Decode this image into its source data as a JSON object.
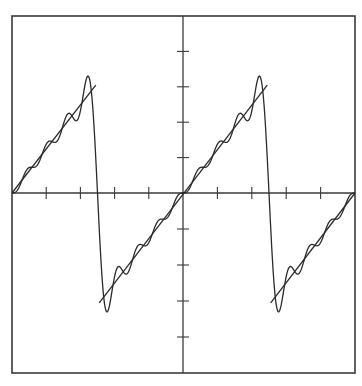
{
  "chart_data": {
    "type": "line",
    "title": "",
    "xlabel": "",
    "ylabel": "",
    "xlim": [
      -5,
      5
    ],
    "ylim": [
      -5,
      5
    ],
    "grid": false,
    "legend": null,
    "axes": {
      "x_ticks": [
        -5,
        -4,
        -3,
        -2,
        -1,
        0,
        1,
        2,
        3,
        4,
        5
      ],
      "y_ticks": [
        -5,
        -4,
        -3,
        -2,
        -1,
        0,
        1,
        2,
        3,
        4,
        5
      ],
      "tick_labels_shown": false,
      "center_axes": true,
      "frame": true
    },
    "signal": {
      "period": 5,
      "amplitude": 3.1,
      "jump_positions_x": [
        -2.5,
        2.5
      ],
      "harmonics": 8
    },
    "series": [
      {
        "name": "ideal sawtooth",
        "style": "straight segments",
        "segments": [
          {
            "x": [
              -5,
              -2.55
            ],
            "y": [
              0,
              3.05
            ]
          },
          {
            "x": [
              -2.45,
              2.45
            ],
            "y": [
              -3.05,
              3.05
            ]
          },
          {
            "x": [
              2.55,
              5
            ],
            "y": [
              -3.05,
              0
            ]
          }
        ]
      },
      {
        "name": "fourier approximation",
        "style": "smooth curve",
        "key_points": [
          {
            "x": -5.0,
            "y": 0.0
          },
          {
            "x": -2.8,
            "y": 3.3
          },
          {
            "x": -2.5,
            "y": 0.0
          },
          {
            "x": -2.2,
            "y": -3.3
          },
          {
            "x": 0.0,
            "y": 0.0
          },
          {
            "x": 2.2,
            "y": 3.3
          },
          {
            "x": 2.5,
            "y": 0.0
          },
          {
            "x": 2.8,
            "y": -3.3
          },
          {
            "x": 5.0,
            "y": 0.0
          }
        ]
      }
    ]
  },
  "colors": {
    "background": "#ffffff",
    "frame": "#3a3a3a",
    "axis": "#3a3a3a",
    "curve": "#2a2a2a"
  },
  "layout": {
    "frame_px": {
      "left": 12,
      "top": 16,
      "right": 355,
      "bottom": 373
    },
    "origin_px": {
      "x": 183,
      "y": 193
    }
  }
}
